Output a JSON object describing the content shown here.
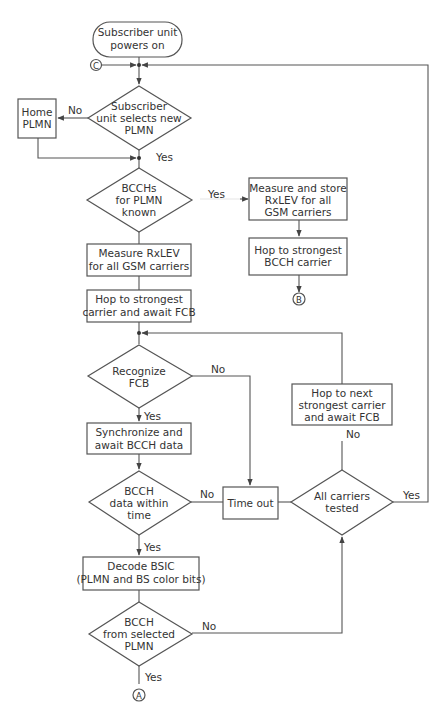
{
  "diagram": {
    "nodes": {
      "start": {
        "lines": [
          "Subscriber unit",
          "powers on"
        ]
      },
      "select_plmn": {
        "lines": [
          "Subscriber",
          "unit selects new",
          "PLMN"
        ]
      },
      "home_plmn": {
        "lines": [
          "Home",
          "PLMN"
        ]
      },
      "bcch_known": {
        "lines": [
          "BCCHs",
          "for PLMN",
          "known"
        ]
      },
      "measure_store": {
        "lines": [
          "Measure and store",
          "RxLEV for all",
          "GSM carriers"
        ]
      },
      "hop_bcch": {
        "lines": [
          "Hop to strongest",
          "BCCH carrier"
        ]
      },
      "measure_rxlev": {
        "lines": [
          "Measure RxLEV",
          "for all GSM carriers"
        ]
      },
      "hop_strongest": {
        "lines": [
          "Hop to strongest",
          "carrier and await FCB"
        ]
      },
      "recognize_fcb": {
        "lines": [
          "Recognize",
          "FCB"
        ]
      },
      "hop_next": {
        "lines": [
          "Hop to next",
          "strongest carrier",
          "and await FCB"
        ]
      },
      "synchronize": {
        "lines": [
          "Synchronize and",
          "await BCCH data"
        ]
      },
      "bcch_time": {
        "lines": [
          "BCCH",
          "data within",
          "time"
        ]
      },
      "time_out": {
        "lines": [
          "Time out"
        ]
      },
      "all_tested": {
        "lines": [
          "All carriers",
          "tested"
        ]
      },
      "decode_bsic": {
        "lines": [
          "Decode BSIC",
          "(PLMN and BS color bits)"
        ]
      },
      "bcch_selected": {
        "lines": [
          "BCCH",
          "from selected",
          "PLMN"
        ]
      }
    },
    "connectors": {
      "a": "A",
      "b": "B",
      "c": "C"
    },
    "edge_labels": {
      "select_no": "No",
      "select_yes": "Yes",
      "bcch_known_yes": "Yes",
      "recognize_no": "No",
      "recognize_yes": "Yes",
      "hop_next_no": "No",
      "bcch_time_no": "No",
      "bcch_time_yes": "Yes",
      "all_tested_yes": "Yes",
      "bcch_selected_no": "No",
      "bcch_selected_yes": "Yes"
    }
  }
}
